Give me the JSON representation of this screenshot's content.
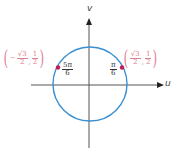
{
  "diagram": {
    "type": "unit-circle",
    "axes": {
      "horizontal_label": "u",
      "vertical_label": "v"
    },
    "colors": {
      "circle": "#3a8fd0",
      "point": "#c21e56",
      "coordinate_text": "#e0808f",
      "angle_text": "#333333",
      "axis": "#555555"
    },
    "points": [
      {
        "id": "pi-over-6",
        "angle_label": {
          "numerator": "π",
          "denominator": "6"
        },
        "coordinate": {
          "x": {
            "sign": "",
            "numerator": "√3",
            "denominator": "2"
          },
          "separator": ",",
          "y": {
            "numerator": "1",
            "denominator": "2"
          }
        }
      },
      {
        "id": "5pi-over-6",
        "angle_label": {
          "numerator": "5π",
          "denominator": "6"
        },
        "coordinate": {
          "x": {
            "sign": "−",
            "numerator": "√3",
            "denominator": "2"
          },
          "separator": ",",
          "y": {
            "numerator": "1",
            "denominator": "2"
          }
        }
      }
    ],
    "paren_open": "(",
    "paren_close": ")"
  }
}
